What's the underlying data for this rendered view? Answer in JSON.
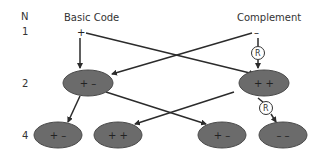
{
  "labels": {
    "n_header": "N",
    "row1": "1",
    "row2": "2",
    "row4": "4",
    "basic_code": "Basic Code",
    "complement": "Complement"
  },
  "top_signs": {
    "basic": "+",
    "complement": "–"
  },
  "reverse_marker": "R",
  "nodes": {
    "gen2_left": "+ –",
    "gen2_right": "+ +",
    "gen4_1": "+ –",
    "gen4_2": "+ +",
    "gen4_3": "+ –",
    "gen4_4": "– –"
  },
  "colors": {
    "node_fill": "#6b6b6b",
    "node_stroke": "#4a4a4a",
    "arrow": "#2b2b2b",
    "text": "#333333"
  }
}
